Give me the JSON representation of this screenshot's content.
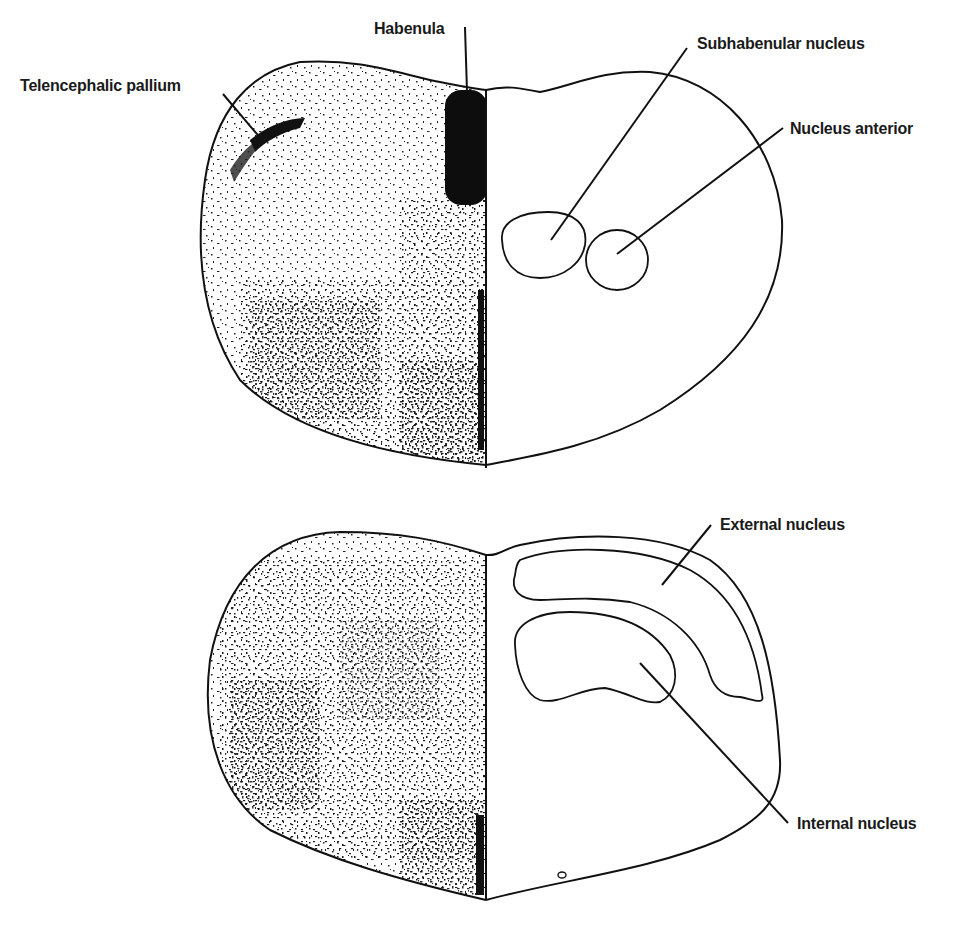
{
  "figure": {
    "type": "anatomical-diagram",
    "sections": [
      {
        "id": "upper-section",
        "labels": [
          {
            "key": "telencephalic_pallium",
            "text": "Telencephalic pallium"
          },
          {
            "key": "habenula",
            "text": "Habenula"
          },
          {
            "key": "subhabenular_nucleus",
            "text": "Subhabenular nucleus"
          },
          {
            "key": "nucleus_anterior",
            "text": "Nucleus anterior"
          }
        ]
      },
      {
        "id": "lower-section",
        "labels": [
          {
            "key": "external_nucleus",
            "text": "External nucleus"
          },
          {
            "key": "internal_nucleus",
            "text": "Internal nucleus"
          }
        ]
      }
    ]
  },
  "colors": {
    "ink": "#111111",
    "background": "#ffffff"
  }
}
